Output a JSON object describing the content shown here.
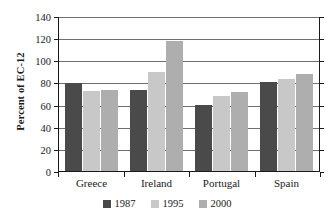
{
  "chart_data": {
    "type": "bar",
    "title": "",
    "xlabel": "",
    "ylabel": "Percent of EC-12",
    "ylim": [
      0,
      140
    ],
    "ytick_step": 20,
    "yticks": [
      140,
      120,
      100,
      80,
      60,
      40,
      20,
      0
    ],
    "grid": true,
    "legend_position": "bottom",
    "categories": [
      "Greece",
      "Ireland",
      "Portugal",
      "Spain"
    ],
    "series": [
      {
        "name": "1987",
        "color": "#4a4a4a",
        "values": [
          80,
          74,
          60,
          81
        ]
      },
      {
        "name": "1995",
        "color": "#c8c8c8",
        "values": [
          73,
          90,
          68,
          84
        ]
      },
      {
        "name": "2000",
        "color": "#aeaeae",
        "values": [
          74,
          118,
          72,
          88
        ]
      }
    ]
  },
  "axis": {
    "y_title": "Percent of EC-12"
  }
}
